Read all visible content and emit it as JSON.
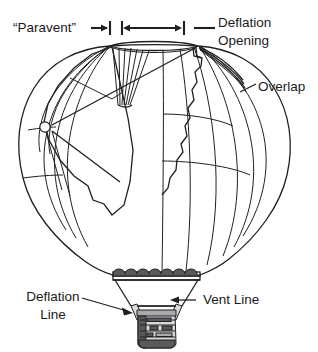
{
  "figure": {
    "background_color": "#ffffff",
    "line_color": "#231f20",
    "width": 318,
    "height": 352
  },
  "labels": {
    "paravent": "“Paravent”",
    "deflation_opening_line1": "Deflation",
    "deflation_opening_line2": "Opening",
    "overlap": "Overlap",
    "deflation_line_line1": "Deflation",
    "deflation_line_line2": "Line",
    "vent_line": "Vent Line"
  },
  "annotations": [
    {
      "name": "paravent",
      "text": "“Paravent”",
      "leader": "arrow-right-to-tick",
      "target": "top-left of deflation opening"
    },
    {
      "name": "deflation-opening",
      "text": "Deflation Opening",
      "leader": "double-headed-dimension-arrow",
      "target": "top vent opening span"
    },
    {
      "name": "overlap",
      "text": "Overlap",
      "leader": "diagonal-line",
      "target": "envelope fabric overlap edge"
    },
    {
      "name": "deflation-line",
      "text": "Deflation Line",
      "leader": "arrow-right",
      "target": "basket left side"
    },
    {
      "name": "vent-line",
      "text": "Vent Line",
      "leader": "arrow-left",
      "target": "burner frame upright"
    }
  ],
  "parts": {
    "envelope": "balloon-envelope",
    "gores": "vertical-gore-seams",
    "parallels": "horizontal-load-tapes",
    "pleats": "paravent-pleats",
    "mouth": "envelope-mouth-scallops",
    "frame": "burner-frame",
    "basket": "wicker-basket",
    "ring": "deflation-line-pulley-ring"
  }
}
